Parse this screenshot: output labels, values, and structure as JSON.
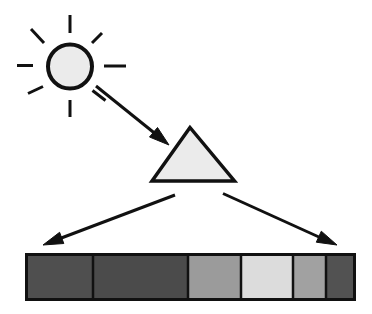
{
  "diagram": {
    "sun": {
      "fill": "#ebebeb",
      "stroke": "#111111",
      "ray_count": 8
    },
    "prism": {
      "shape": "triangle",
      "fill": "#ebebeb",
      "stroke": "#111111"
    },
    "arrows": [
      {
        "from": "sun",
        "to": "prism"
      },
      {
        "from": "prism",
        "to": "spectrum-left-end"
      },
      {
        "from": "prism",
        "to": "spectrum-right-end"
      }
    ],
    "arrow_color": "#111111"
  },
  "spectrum": {
    "border_color": "#111111",
    "segments": [
      {
        "index": 1,
        "shade": "dark gray",
        "color": "#4f4f4f"
      },
      {
        "index": 2,
        "shade": "dark gray",
        "color": "#4b4b4b"
      },
      {
        "index": 3,
        "shade": "medium gray",
        "color": "#9b9b9b"
      },
      {
        "index": 4,
        "shade": "light gray",
        "color": "#dcdcdc"
      },
      {
        "index": 5,
        "shade": "medium gray",
        "color": "#a1a1a1"
      },
      {
        "index": 6,
        "shade": "dark gray",
        "color": "#525252"
      }
    ]
  }
}
